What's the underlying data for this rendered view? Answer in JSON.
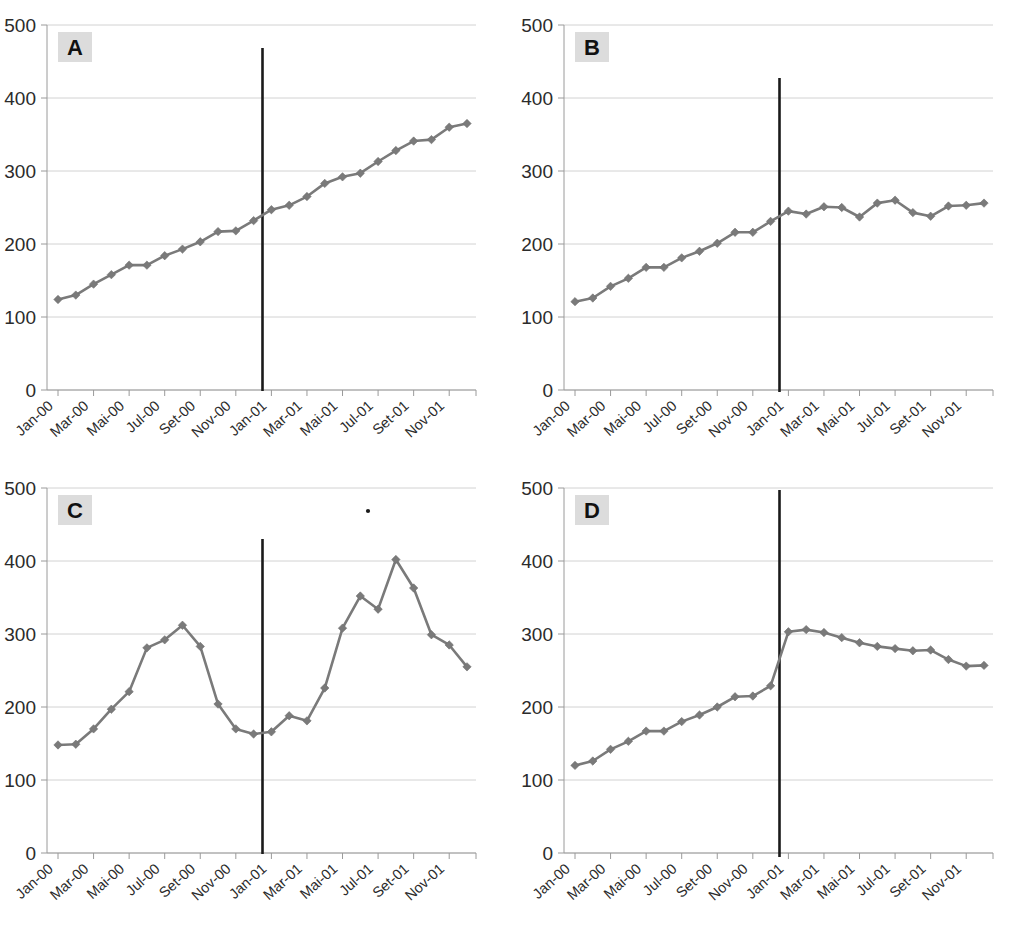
{
  "figure": {
    "layout": "2x2 grid of line charts",
    "panels_order": [
      "A",
      "B",
      "C",
      "D"
    ]
  },
  "axis": {
    "y_ticks": [
      "0",
      "100",
      "200",
      "300",
      "400",
      "500"
    ],
    "y_min": 0,
    "y_max": 500,
    "x_labels": [
      "Jan-00",
      "Mar-00",
      "Mai-00",
      "Jul-00",
      "Set-00",
      "Nov-00",
      "Jan-01",
      "Mar-01",
      "Mai-01",
      "Jul-01",
      "Set-01",
      "Nov-01"
    ],
    "x_all_months": [
      "Jan-00",
      "Fev-00",
      "Mar-00",
      "Abr-00",
      "Mai-00",
      "Jun-00",
      "Jul-00",
      "Ago-00",
      "Set-00",
      "Out-00",
      "Nov-00",
      "Dez-00",
      "Jan-01",
      "Fev-01",
      "Mar-01",
      "Abr-01",
      "Mai-01",
      "Jun-01",
      "Jul-01",
      "Ago-01",
      "Set-01",
      "Out-01",
      "Nov-01",
      "Dez-01"
    ]
  },
  "colors": {
    "series": "#7a7a7a",
    "marker": "#7a7a7a",
    "intervention_line": "#1a1a1a",
    "gridline": "#d2d2d2",
    "badge_bg": "#dcdcdc",
    "badge_text": "#111111",
    "tick_text": "#2b2b2b"
  },
  "chart_data": [
    {
      "type": "line",
      "title": "A",
      "panel_label": "A",
      "xlabel": "",
      "ylabel": "",
      "ylim": [
        0,
        500
      ],
      "grid": true,
      "legend": "none",
      "marker": "diamond",
      "x": [
        "Jan-00",
        "Fev-00",
        "Mar-00",
        "Abr-00",
        "Mai-00",
        "Jun-00",
        "Jul-00",
        "Ago-00",
        "Set-00",
        "Out-00",
        "Nov-00",
        "Dez-00",
        "Jan-01",
        "Fev-01",
        "Mar-01",
        "Abr-01",
        "Mai-01",
        "Jun-01",
        "Jul-01",
        "Ago-01",
        "Set-01",
        "Out-01",
        "Nov-01",
        "Dez-01"
      ],
      "values": [
        124,
        130,
        145,
        158,
        171,
        171,
        184,
        193,
        203,
        217,
        218,
        232,
        247,
        253,
        265,
        283,
        292,
        297,
        313,
        328,
        341,
        343,
        360,
        365
      ],
      "annotations": [
        {
          "type": "vertical-line",
          "at": "Dez-00/Jan-01",
          "label": "intervention"
        }
      ]
    },
    {
      "type": "line",
      "title": "B",
      "panel_label": "B",
      "xlabel": "",
      "ylabel": "",
      "ylim": [
        0,
        500
      ],
      "grid": true,
      "legend": "none",
      "marker": "diamond",
      "x": [
        "Jan-00",
        "Fev-00",
        "Mar-00",
        "Abr-00",
        "Mai-00",
        "Jun-00",
        "Jul-00",
        "Ago-00",
        "Set-00",
        "Out-00",
        "Nov-00",
        "Dez-00",
        "Jan-01",
        "Fev-01",
        "Mar-01",
        "Abr-01",
        "Mai-01",
        "Jun-01",
        "Jul-01",
        "Ago-01",
        "Set-01",
        "Out-01",
        "Nov-01",
        "Dez-01"
      ],
      "values": [
        121,
        126,
        142,
        153,
        168,
        168,
        181,
        190,
        201,
        216,
        216,
        231,
        245,
        241,
        251,
        250,
        237,
        256,
        260,
        243,
        238,
        252,
        253,
        256
      ],
      "annotations": [
        {
          "type": "vertical-line",
          "at": "Dez-00/Jan-01",
          "label": "intervention"
        }
      ]
    },
    {
      "type": "line",
      "title": "C",
      "panel_label": "C",
      "xlabel": "",
      "ylabel": "",
      "ylim": [
        0,
        500
      ],
      "grid": true,
      "legend": "none",
      "marker": "diamond",
      "x": [
        "Jan-00",
        "Fev-00",
        "Mar-00",
        "Abr-00",
        "Mai-00",
        "Jun-00",
        "Jul-00",
        "Ago-00",
        "Set-00",
        "Out-00",
        "Nov-00",
        "Dez-00",
        "Jan-01",
        "Fev-01",
        "Mar-01",
        "Abr-01",
        "Mai-01",
        "Jun-01",
        "Jul-01",
        "Ago-01",
        "Set-01",
        "Out-01",
        "Nov-01",
        "Dez-01"
      ],
      "values": [
        148,
        149,
        170,
        197,
        221,
        281,
        292,
        312,
        283,
        204,
        170,
        163,
        166,
        188,
        181,
        226,
        308,
        352,
        334,
        402,
        363,
        299,
        285,
        255
      ],
      "annotations": [
        {
          "type": "vertical-line",
          "at": "Dez-00/Jan-01",
          "label": "intervention"
        },
        {
          "type": "speck",
          "label": "scan-artifact-dot"
        }
      ]
    },
    {
      "type": "line",
      "title": "D",
      "panel_label": "D",
      "xlabel": "",
      "ylabel": "",
      "ylim": [
        0,
        500
      ],
      "grid": true,
      "legend": "none",
      "marker": "diamond",
      "x": [
        "Jan-00",
        "Fev-00",
        "Mar-00",
        "Abr-00",
        "Mai-00",
        "Jun-00",
        "Jul-00",
        "Ago-00",
        "Set-00",
        "Out-00",
        "Nov-00",
        "Dez-00",
        "Jan-01",
        "Fev-01",
        "Mar-01",
        "Abr-01",
        "Mai-01",
        "Jun-01",
        "Jul-01",
        "Ago-01",
        "Set-01",
        "Out-01",
        "Nov-01",
        "Dez-01"
      ],
      "values": [
        120,
        126,
        142,
        153,
        167,
        167,
        180,
        189,
        200,
        214,
        215,
        229,
        303,
        306,
        302,
        295,
        288,
        283,
        280,
        277,
        278,
        265,
        256,
        257
      ],
      "annotations": [
        {
          "type": "vertical-line",
          "at": "Dez-00/Jan-01",
          "label": "intervention"
        }
      ]
    }
  ]
}
